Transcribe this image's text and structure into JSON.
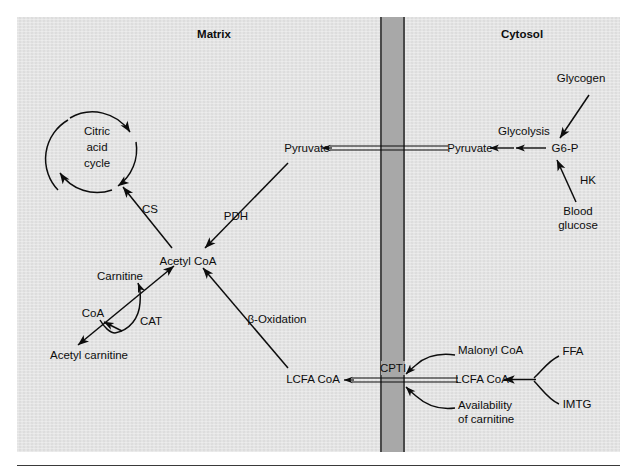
{
  "figure": {
    "compartments": {
      "matrix_label": "Matrix",
      "cytosol_label": "Cytosol",
      "membrane_label": "CPTI"
    },
    "colors": {
      "panel_background": "#e2e2e2",
      "membrane_fill": "#a8a8a8",
      "membrane_edge": "#4a4a4a",
      "ink": "#0d0d0d",
      "page_background": "#ffffff"
    },
    "nodes": [
      {
        "id": "citric-acid-cycle",
        "label": "Citric\nacid\ncycle",
        "lines": [
          "Citric",
          "acid",
          "cycle"
        ],
        "compartment": "matrix"
      },
      {
        "id": "acetyl-coa",
        "label": "Acetyl CoA",
        "compartment": "matrix"
      },
      {
        "id": "pyruvate-matrix",
        "label": "Pyruvate",
        "compartment": "matrix"
      },
      {
        "id": "carnitine",
        "label": "Carnitine",
        "compartment": "matrix"
      },
      {
        "id": "coa",
        "label": "CoA",
        "compartment": "matrix"
      },
      {
        "id": "acetyl-carnitine",
        "label": "Acetyl carnitine",
        "compartment": "matrix"
      },
      {
        "id": "lcfa-coa-matrix",
        "label": "LCFA CoA",
        "compartment": "matrix"
      },
      {
        "id": "pyruvate-cytosol",
        "label": "Pyruvate",
        "compartment": "cytosol"
      },
      {
        "id": "g6p",
        "label": "G6-P",
        "compartment": "cytosol"
      },
      {
        "id": "glycogen",
        "label": "Glycogen",
        "compartment": "cytosol"
      },
      {
        "id": "blood-glucose",
        "label": "Blood\nglucose",
        "lines": [
          "Blood",
          "glucose"
        ],
        "compartment": "cytosol"
      },
      {
        "id": "lcfa-coa-cytosol",
        "label": "LCFA CoA",
        "compartment": "cytosol"
      },
      {
        "id": "malonyl-coa",
        "label": "Malonyl CoA",
        "compartment": "cytosol"
      },
      {
        "id": "availability-of-carnitine",
        "label": "Availability\nof carnitine",
        "lines": [
          "Availability",
          "of carnitine"
        ],
        "compartment": "cytosol"
      },
      {
        "id": "ffa",
        "label": "FFA",
        "compartment": "cytosol"
      },
      {
        "id": "imtg",
        "label": "IMTG",
        "compartment": "cytosol"
      }
    ],
    "enzyme_labels": [
      {
        "id": "cs",
        "label": "CS",
        "reaction": "acetyl-coa to citric-acid-cycle"
      },
      {
        "id": "pdh",
        "label": "PDH",
        "reaction": "pyruvate-matrix to acetyl-coa"
      },
      {
        "id": "cat",
        "label": "CAT",
        "reaction": "acetyl-carnitine to acetyl-coa"
      },
      {
        "id": "beta-oxidation",
        "label": "β-Oxidation",
        "reaction": "lcfa-coa-matrix to acetyl-coa"
      },
      {
        "id": "glycolysis",
        "label": "Glycolysis",
        "reaction": "g6p to pyruvate-cytosol"
      },
      {
        "id": "hk",
        "label": "HK",
        "reaction": "blood-glucose to g6p"
      }
    ],
    "edges": [
      {
        "from": "acetyl-coa",
        "to": "citric-acid-cycle",
        "label": "CS",
        "style": "single-arrow"
      },
      {
        "from": "pyruvate-matrix",
        "to": "acetyl-coa",
        "label": "PDH",
        "style": "single-arrow"
      },
      {
        "from": "acetyl-carnitine",
        "to": "acetyl-coa",
        "label": "CAT",
        "style": "double-headed-arrow"
      },
      {
        "from": "coa",
        "to": "carnitine",
        "label": "",
        "style": "curved-arrow"
      },
      {
        "from": "lcfa-coa-matrix",
        "to": "acetyl-coa",
        "label": "β-Oxidation",
        "style": "single-arrow"
      },
      {
        "from": "pyruvate-cytosol",
        "to": "pyruvate-matrix",
        "label": "",
        "style": "double-line-transport-arrow"
      },
      {
        "from": "g6p",
        "to": "pyruvate-cytosol",
        "label": "Glycolysis",
        "style": "two-arrowheads"
      },
      {
        "from": "glycogen",
        "to": "g6p",
        "label": "",
        "style": "single-arrow"
      },
      {
        "from": "blood-glucose",
        "to": "g6p",
        "label": "HK",
        "style": "single-arrow"
      },
      {
        "from": "lcfa-coa-cytosol",
        "to": "lcfa-coa-matrix",
        "label": "CPTI",
        "style": "double-line-transport-arrow"
      },
      {
        "from": "malonyl-coa",
        "to": "cpti-site",
        "label": "",
        "style": "curved-arrow"
      },
      {
        "from": "availability-of-carnitine",
        "to": "cpti-site",
        "label": "",
        "style": "curved-arrow"
      },
      {
        "from": "ffa",
        "to": "lcfa-coa-cytosol",
        "label": "",
        "style": "curved-converging-arrow"
      },
      {
        "from": "imtg",
        "to": "lcfa-coa-cytosol",
        "label": "",
        "style": "curved-converging-arrow"
      }
    ]
  }
}
